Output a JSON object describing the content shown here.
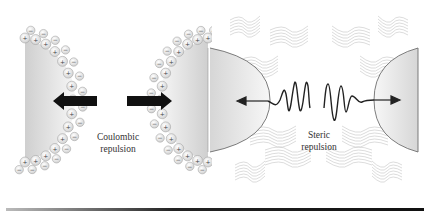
{
  "figure": {
    "left_panel": {
      "title": "Coulombic repulsion",
      "label_line1": "Coulombic",
      "label_line2": "repulsion",
      "inner_charge": "+",
      "outer_charge": "−",
      "arrow_color": "#111111"
    },
    "right_panel": {
      "title": "Steric repulsion",
      "label_line1": "Steric",
      "label_line2": "repulsion",
      "arrow_color": "#222222"
    },
    "colors": {
      "particle_fill_light": "#f4f4f4",
      "particle_fill_dark": "#c8c8c8",
      "ion_fill": "#f2f2f2",
      "ion_stroke": "#999999",
      "polymer_stroke": "#c0c0c0",
      "wave_stroke": "#222222"
    }
  }
}
